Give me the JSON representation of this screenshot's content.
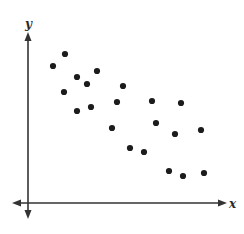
{
  "chart_data": {
    "type": "scatter",
    "title": "",
    "xlabel": "x",
    "ylabel": "y",
    "grid": false,
    "legend": null,
    "ticks": {
      "x": [],
      "y": []
    },
    "axes_style": "two-headed arrows on both axes, no tick labels",
    "origin_px": [
      28,
      203
    ],
    "xlim": [
      -14,
      198
    ],
    "ylim": [
      -15,
      170
    ],
    "points": [
      {
        "x": 37,
        "y": 149
      },
      {
        "x": 25,
        "y": 137
      },
      {
        "x": 49,
        "y": 126
      },
      {
        "x": 69,
        "y": 132
      },
      {
        "x": 59,
        "y": 119
      },
      {
        "x": 36,
        "y": 111
      },
      {
        "x": 95,
        "y": 117
      },
      {
        "x": 49,
        "y": 92
      },
      {
        "x": 63,
        "y": 96
      },
      {
        "x": 89,
        "y": 101
      },
      {
        "x": 124,
        "y": 102
      },
      {
        "x": 153,
        "y": 100
      },
      {
        "x": 84,
        "y": 75
      },
      {
        "x": 128,
        "y": 80
      },
      {
        "x": 147,
        "y": 69
      },
      {
        "x": 173,
        "y": 73
      },
      {
        "x": 102,
        "y": 55
      },
      {
        "x": 116,
        "y": 51
      },
      {
        "x": 141,
        "y": 32
      },
      {
        "x": 155,
        "y": 27
      },
      {
        "x": 176,
        "y": 30
      }
    ],
    "trend": "negative correlation",
    "point_color": "#1c1c1c",
    "axis_color": "#333333"
  },
  "labels": {
    "x_axis": "x",
    "y_axis": "y"
  }
}
